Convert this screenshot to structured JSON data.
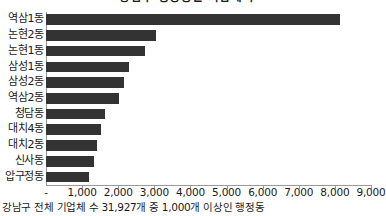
{
  "chart_data": {
    "type": "bar",
    "orientation": "horizontal",
    "title": "강남구 행정동별 기업체 수",
    "xlabel": "",
    "ylabel": "",
    "grid": false,
    "legend": "none",
    "xlim": [
      0,
      9000
    ],
    "categories": [
      "역삼1동",
      "논현2동",
      "논현1동",
      "삼성1동",
      "삼성2동",
      "역삼2동",
      "청담동",
      "대치4동",
      "대치2동",
      "신사동",
      "압구정동"
    ],
    "values": [
      8130,
      3050,
      2750,
      2310,
      2150,
      2020,
      1620,
      1530,
      1420,
      1330,
      1180
    ],
    "xticks": [
      0,
      1000,
      2000,
      3000,
      4000,
      5000,
      6000,
      7000,
      8000,
      9000
    ],
    "xtick_labels": [
      "-",
      "1,000",
      "2,000",
      "3,000",
      "4,000",
      "5,000",
      "6,000",
      "7,000",
      "8,000",
      "9,000"
    ],
    "bar_color": "#333333",
    "axis_color": "#9a9a9a",
    "footnote": "강남구 전체 기업체 수 31,927개 중 1,000개 이상인 행정동"
  }
}
